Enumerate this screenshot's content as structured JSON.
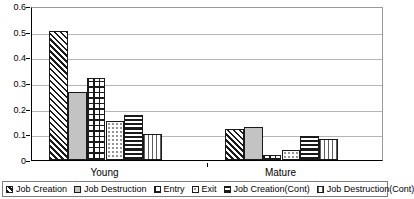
{
  "chart_data": {
    "type": "bar",
    "title": "",
    "xlabel": "",
    "ylabel": "",
    "ylim": [
      0,
      0.6
    ],
    "ytick_labels": [
      "0.6",
      "0.5",
      "0.4",
      "0.3",
      "0.2",
      "0.1",
      "0"
    ],
    "ytick_values": [
      0.6,
      0.5,
      0.4,
      0.3,
      0.2,
      0.1,
      0
    ],
    "grid": true,
    "legend_position": "bottom",
    "categories": [
      "Young",
      "Mature"
    ],
    "series": [
      {
        "name": "Job Creation",
        "pattern": "diagonal-hatch",
        "values": [
          0.503,
          0.12
        ]
      },
      {
        "name": "Job Destruction",
        "pattern": "solid-gray",
        "values": [
          0.264,
          0.127
        ]
      },
      {
        "name": "Entry",
        "pattern": "cross-hatch",
        "values": [
          0.319,
          0.018
        ]
      },
      {
        "name": "Exit",
        "pattern": "light-dots",
        "values": [
          0.153,
          0.04
        ]
      },
      {
        "name": "Job Creation(Cont)",
        "pattern": "horizontal-lines",
        "values": [
          0.176,
          0.094
        ]
      },
      {
        "name": "Job Destruction(Cont)",
        "pattern": "vertical-lines",
        "values": [
          0.103,
          0.081
        ]
      }
    ]
  }
}
